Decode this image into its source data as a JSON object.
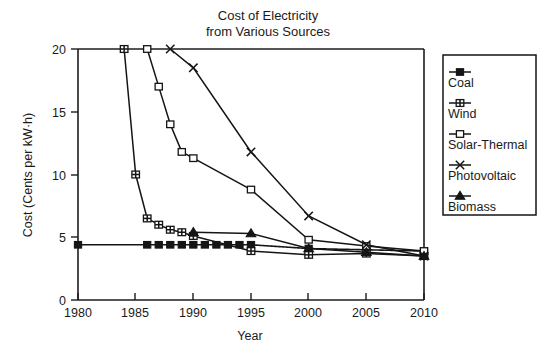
{
  "chart_data": {
    "type": "line",
    "title": "Cost of Electricity\nfrom Various Sources",
    "title_line1": "Cost of Electricity",
    "title_line2": "from Various Sources",
    "xlabel": "Year",
    "ylabel": "Cost (Cents per kW·h)",
    "xlim": [
      1980,
      2010
    ],
    "ylim": [
      0,
      20
    ],
    "xticks": [
      1980,
      1985,
      1990,
      1995,
      2000,
      2005,
      2010
    ],
    "xtick_labels": [
      "1980",
      "1985",
      "1990",
      "1995",
      "2000",
      "2005",
      "2010"
    ],
    "yticks": [
      0,
      5,
      10,
      15,
      20
    ],
    "ytick_labels": [
      "0",
      "5",
      "10",
      "15",
      "20"
    ],
    "grid": false,
    "legend_position": "right-outside",
    "series": [
      {
        "name": "Coal",
        "marker": "filled-square",
        "line_style": "dashed",
        "x": [
          1980,
          1986,
          1987,
          1988,
          1989,
          1990,
          1991,
          1992,
          1993,
          1994,
          1995,
          2000,
          2005,
          2010
        ],
        "y": [
          4.4,
          4.4,
          4.4,
          4.4,
          4.4,
          4.4,
          4.4,
          4.4,
          4.4,
          4.4,
          4.4,
          4.1,
          4.0,
          3.9
        ]
      },
      {
        "name": "Wind",
        "marker": "crossed-square",
        "line_style": "solid",
        "x": [
          1984,
          1985,
          1986,
          1987,
          1988,
          1989,
          1990,
          1995,
          2000,
          2005,
          2010
        ],
        "y": [
          20.0,
          10.0,
          6.5,
          6.0,
          5.6,
          5.4,
          5.1,
          3.9,
          3.6,
          3.7,
          3.5
        ]
      },
      {
        "name": "Solar-Thermal",
        "marker": "open-square",
        "line_style": "solid",
        "x": [
          1986,
          1987,
          1988,
          1989,
          1990,
          1995,
          2000,
          2005,
          2010
        ],
        "y": [
          20.0,
          17.0,
          14.0,
          11.8,
          11.3,
          8.8,
          4.8,
          4.3,
          3.9
        ]
      },
      {
        "name": "Photovoltaic",
        "marker": "x",
        "line_style": "solid",
        "x": [
          1988,
          1990,
          1995,
          2000,
          2005,
          2010
        ],
        "y": [
          20.0,
          18.5,
          11.8,
          6.7,
          4.4,
          3.5
        ]
      },
      {
        "name": "Biomass",
        "marker": "filled-triangle",
        "line_style": "solid",
        "x": [
          1990,
          1995,
          2000,
          2005,
          2010
        ],
        "y": [
          5.4,
          5.3,
          4.1,
          3.8,
          3.5
        ]
      }
    ]
  },
  "legend": {
    "items": [
      {
        "label": "Coal",
        "marker": "filled-square"
      },
      {
        "label": "Wind",
        "marker": "crossed-square"
      },
      {
        "label": "Solar-Thermal",
        "marker": "open-square"
      },
      {
        "label": "Photovoltaic",
        "marker": "x"
      },
      {
        "label": "Biomass",
        "marker": "filled-triangle"
      }
    ]
  },
  "colors": {
    "ink": "#151515",
    "background": "#ffffff"
  }
}
